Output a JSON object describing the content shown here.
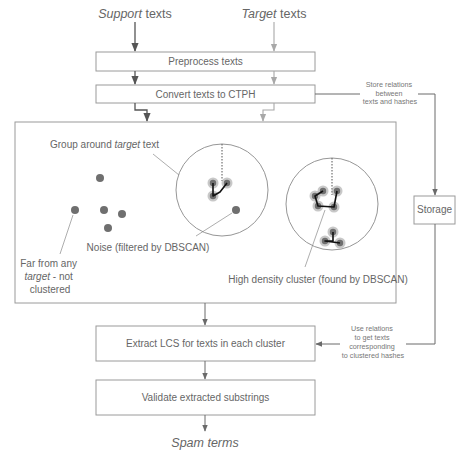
{
  "inputs": {
    "support": {
      "italic": "Support",
      "rest": " texts"
    },
    "target": {
      "italic": "Target",
      "rest": " texts"
    }
  },
  "steps": {
    "preprocess": "Preprocess texts",
    "convert": "Convert texts to CTPH",
    "extract": "Extract LCS for texts in each cluster",
    "validate": "Validate extracted substrings"
  },
  "output": "Spam terms",
  "storage": {
    "label": "Storage",
    "store_note": [
      "Store relations",
      "between",
      "texts and hashes"
    ],
    "use_note": [
      "Use relations",
      "to get texts",
      "corresponding",
      "to clustered hashes"
    ]
  },
  "clustering_panel": {
    "group_label": {
      "pre": "Group around ",
      "italic": "target",
      "post": " text"
    },
    "noise_label": "Noise (filtered by DBSCAN)",
    "far_label": {
      "line1": "Far from any",
      "line2_italic": "target",
      "line2_rest": " - not",
      "line3": "clustered"
    },
    "cluster_label": "High density cluster (found by DBSCAN)"
  },
  "colors": {
    "support_flow": "#555555",
    "target_flow": "#a8a8a8",
    "box_border": "#9a9a9a",
    "text": "#666666",
    "point": "#6f6f6f"
  }
}
